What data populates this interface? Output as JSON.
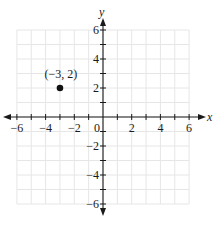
{
  "chart_data": {
    "type": "scatter",
    "title": "",
    "xlabel": "x",
    "ylabel": "y",
    "xlim": [
      -6,
      6
    ],
    "ylim": [
      -6,
      6
    ],
    "grid": true,
    "x_ticks": [
      -6,
      -4,
      -2,
      0,
      2,
      4,
      6
    ],
    "y_ticks": [
      -6,
      -4,
      -2,
      2,
      4,
      6
    ],
    "x_tick_labels": [
      "−6",
      "−4",
      "−2",
      "0",
      "2",
      "4",
      "6"
    ],
    "y_tick_labels": [
      "−6",
      "−4",
      "−2",
      "2",
      "4",
      "6"
    ],
    "points": [
      {
        "x": -3,
        "y": 2,
        "label": "(−3, 2)"
      }
    ]
  },
  "colors": {
    "grid": "#e6e6e6",
    "axis": "#1a1a1a",
    "point": "#111111"
  }
}
